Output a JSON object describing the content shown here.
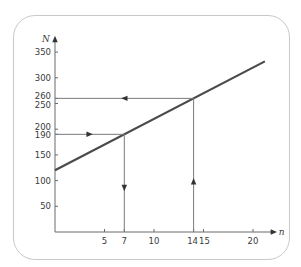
{
  "chart_data": {
    "type": "line",
    "title": "",
    "xlabel": "n",
    "ylabel": "N",
    "xlim": [
      0,
      21.5
    ],
    "ylim": [
      0,
      360
    ],
    "grid": false,
    "legend": null,
    "x_ticks": [
      5,
      7,
      10,
      14,
      15,
      20
    ],
    "x_tick_labels": [
      "5",
      "7",
      "10",
      "14",
      "15",
      "20"
    ],
    "y_ticks": [
      50,
      100,
      150,
      190,
      200,
      250,
      260,
      300,
      350
    ],
    "y_tick_labels": [
      "50",
      "100",
      "150",
      "190",
      "200",
      "250",
      "260",
      "300",
      "350"
    ],
    "series": [
      {
        "name": "N = 120 + 10n",
        "x": [
          0,
          21.2
        ],
        "y": [
          120,
          332
        ],
        "color": "#4a4a4a"
      }
    ],
    "annotations": [
      {
        "type": "arrow-path",
        "description": "From N=190 on y-axis go right to line, then down to n=7",
        "from_y": 190,
        "to_x": 7
      },
      {
        "type": "arrow-path",
        "description": "From n=14 on x-axis go up to line, then left to N=260",
        "from_x": 14,
        "to_y": 260
      }
    ]
  },
  "colors": {
    "frame": "#c9c9c9",
    "axis": "#6a6a6a",
    "line": "#4a4a4a",
    "guide": "#7a7a7a"
  }
}
